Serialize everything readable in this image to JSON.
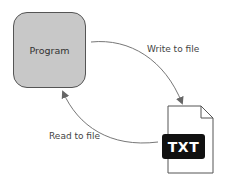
{
  "diagram": {
    "nodes": {
      "program": {
        "label": "Program",
        "fill": "#c8c8c8"
      },
      "file": {
        "badge": "TXT",
        "badge_color": "#111111"
      }
    },
    "edges": {
      "write": {
        "label": "Write to file",
        "from": "program",
        "to": "file"
      },
      "read": {
        "label": "Read to file",
        "from": "file",
        "to": "program"
      }
    }
  }
}
